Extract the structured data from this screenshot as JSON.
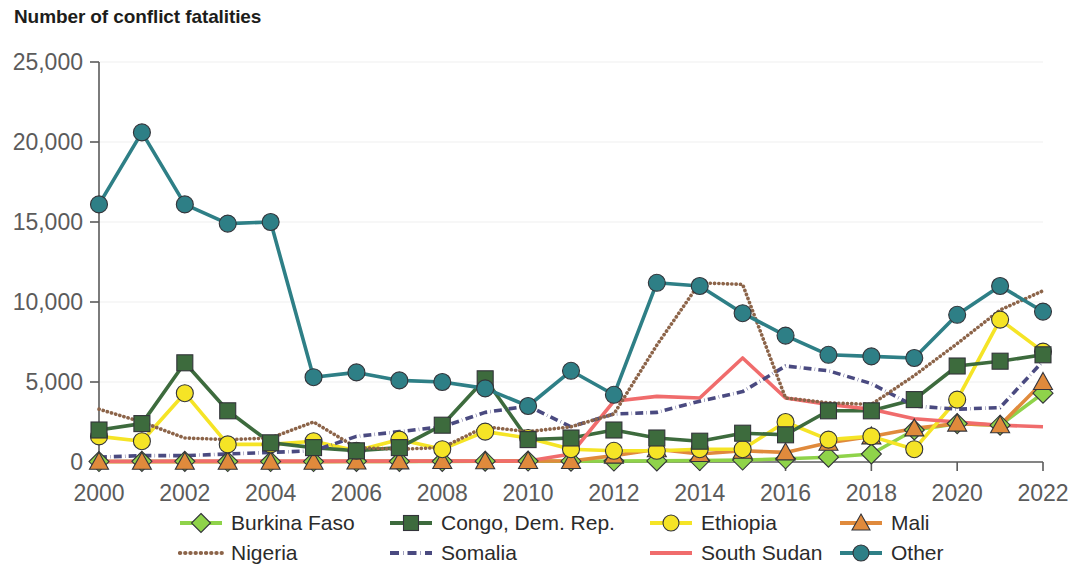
{
  "title": "Number of conflict fatalities",
  "axes": {
    "y_ticks": [
      "0",
      "5,000",
      "10,000",
      "15,000",
      "20,000",
      "25,000"
    ],
    "x_ticks": [
      "2000",
      "2002",
      "2004",
      "2006",
      "2008",
      "2010",
      "2012",
      "2014",
      "2016",
      "2018",
      "2020",
      "2022"
    ]
  },
  "legend": {
    "row1": [
      {
        "label": "Burkina Faso",
        "key": "burkina_faso"
      },
      {
        "label": "Congo, Dem. Rep.",
        "key": "congo"
      },
      {
        "label": "Ethiopia",
        "key": "ethiopia"
      },
      {
        "label": "Mali",
        "key": "mali"
      }
    ],
    "row2": [
      {
        "label": "Nigeria",
        "key": "nigeria"
      },
      {
        "label": "Somalia",
        "key": "somalia"
      },
      {
        "label": "South Sudan",
        "key": "south_sudan"
      },
      {
        "label": "Other",
        "key": "other"
      }
    ]
  },
  "colors": {
    "burkina_faso": "#8fd34a",
    "congo": "#3d6b3d",
    "ethiopia": "#f5e426",
    "mali": "#e08a3c",
    "nigeria": "#8c6449",
    "somalia": "#4a4a80",
    "south_sudan": "#f06c6c",
    "other": "#2e7f86",
    "axis": "#5b5b5b",
    "grid": "#efefef",
    "text": "#1d1d1b",
    "background": "#ffffff"
  },
  "chart_data": {
    "type": "line",
    "title": "Number of conflict fatalities",
    "xlabel": "",
    "ylabel": "Number of conflict fatalities",
    "ylim": [
      0,
      25000
    ],
    "xlim": [
      2000,
      2022
    ],
    "grid": true,
    "legend_position": "bottom",
    "x": [
      2000,
      2001,
      2002,
      2003,
      2004,
      2005,
      2006,
      2007,
      2008,
      2009,
      2010,
      2011,
      2012,
      2013,
      2014,
      2015,
      2016,
      2017,
      2018,
      2019,
      2020,
      2021,
      2022
    ],
    "series": [
      {
        "name": "Burkina Faso",
        "key": "burkina_faso",
        "marker": "diamond",
        "linestyle": "solid",
        "values": [
          30,
          40,
          40,
          30,
          30,
          30,
          40,
          40,
          40,
          50,
          60,
          50,
          60,
          70,
          90,
          120,
          200,
          300,
          500,
          2000,
          2400,
          2300,
          4300
        ]
      },
      {
        "name": "Congo, Dem. Rep.",
        "key": "congo",
        "marker": "square",
        "linestyle": "solid",
        "values": [
          2000,
          2400,
          6200,
          3200,
          1200,
          900,
          700,
          900,
          2300,
          5200,
          1400,
          1500,
          2000,
          1500,
          1300,
          1800,
          1700,
          3200,
          3200,
          3900,
          6000,
          6300,
          6700
        ]
      },
      {
        "name": "Ethiopia",
        "key": "ethiopia",
        "marker": "circle",
        "linestyle": "solid",
        "values": [
          1600,
          1300,
          4300,
          1100,
          1100,
          1300,
          700,
          1400,
          800,
          1900,
          1500,
          800,
          700,
          700,
          800,
          800,
          2500,
          1400,
          1600,
          800,
          3900,
          8900,
          6900
        ]
      },
      {
        "name": "Mali",
        "key": "mali",
        "marker": "triangle",
        "linestyle": "solid",
        "values": [
          20,
          20,
          20,
          20,
          20,
          20,
          30,
          40,
          60,
          50,
          60,
          60,
          400,
          800,
          500,
          700,
          600,
          1200,
          1600,
          2100,
          2400,
          2300,
          5000
        ]
      },
      {
        "name": "Nigeria",
        "key": "nigeria",
        "marker": "none",
        "linestyle": "dotted",
        "values": [
          3300,
          2500,
          1500,
          1400,
          1500,
          2500,
          900,
          800,
          900,
          2200,
          1900,
          2200,
          3000,
          7300,
          11200,
          11100,
          4000,
          3700,
          3600,
          5400,
          7400,
          9500,
          10700
        ]
      },
      {
        "name": "Somalia",
        "key": "somalia",
        "marker": "none",
        "linestyle": "dashdot",
        "values": [
          300,
          400,
          400,
          500,
          600,
          700,
          1600,
          1900,
          2200,
          3100,
          3500,
          2200,
          3000,
          3100,
          3800,
          4400,
          6000,
          5700,
          4900,
          3500,
          3300,
          3400,
          6300
        ]
      },
      {
        "name": "South Sudan",
        "key": "south_sudan",
        "marker": "none",
        "linestyle": "solid",
        "values": [
          50,
          50,
          60,
          60,
          60,
          60,
          60,
          60,
          60,
          60,
          60,
          500,
          3800,
          4100,
          4000,
          6500,
          4000,
          3600,
          3300,
          2700,
          2500,
          2300,
          2200
        ]
      },
      {
        "name": "Other",
        "key": "other",
        "marker": "circle",
        "linestyle": "solid",
        "values": [
          16100,
          20600,
          16100,
          14900,
          15000,
          5300,
          5600,
          5100,
          5000,
          4600,
          3500,
          5700,
          4200,
          11200,
          11000,
          9300,
          7900,
          6700,
          6600,
          6500,
          9200,
          11000,
          9400
        ]
      }
    ]
  }
}
